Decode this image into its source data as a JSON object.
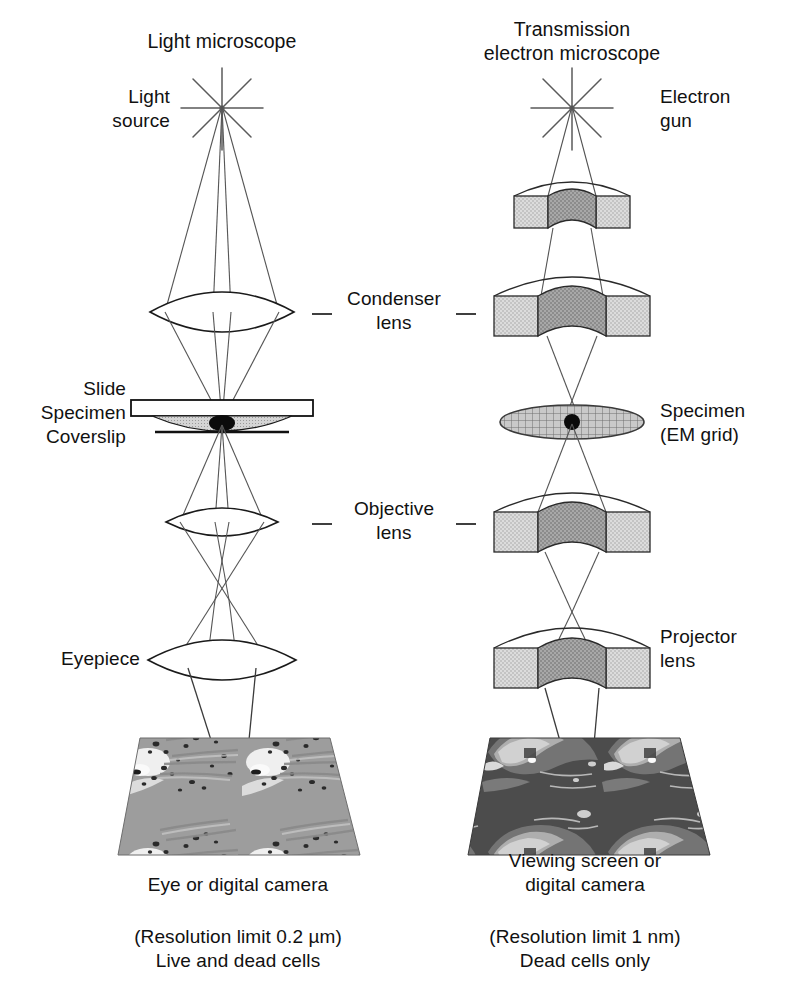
{
  "figure": {
    "background_color": "#ffffff",
    "ink_color": "#111111",
    "ray_color": "#4a4a4a",
    "lens_body_color": "#cfcfcf",
    "lens_core_color": "#8f8f8f",
    "specimen_fill": "#b9b9b9"
  },
  "columns": {
    "left": {
      "title": "Light microscope",
      "title_lines": [
        "Light microscope"
      ],
      "source_label_lines": [
        "Light",
        "source"
      ],
      "source_icon": "starburst-icon",
      "stage_labels": [
        "Slide",
        "Specimen",
        "Coverslip"
      ],
      "eyepiece_label": "Eyepiece",
      "detector_caption_lines": [
        "Eye or digital camera"
      ],
      "footnote_lines": [
        "(Resolution limit 0.2 µm)",
        "Live and dead cells"
      ],
      "image_panel_name": "light-micrograph"
    },
    "right": {
      "title": "Transmission electron microscope",
      "title_lines": [
        "Transmission",
        "electron microscope"
      ],
      "source_label_lines": [
        "Electron",
        "gun"
      ],
      "source_icon": "starburst-icon",
      "specimen_label_lines": [
        "Specimen",
        "(EM grid)"
      ],
      "projector_label_lines": [
        "Projector",
        "lens"
      ],
      "detector_caption_lines": [
        "Viewing screen or",
        "digital camera"
      ],
      "footnote_lines": [
        "(Resolution limit 1 nm)",
        "Dead cells only"
      ],
      "image_panel_name": "electron-micrograph"
    }
  },
  "shared_labels": {
    "condenser": [
      "Condenser",
      "lens"
    ],
    "objective": [
      "Objective",
      "lens"
    ]
  },
  "components": {
    "left_optics": [
      {
        "name": "light-source-star",
        "type": "starburst"
      },
      {
        "name": "condenser-lens-optical",
        "type": "biconvex-lens"
      },
      {
        "name": "slide-assembly",
        "type": "slide"
      },
      {
        "name": "objective-lens-optical",
        "type": "biconvex-lens"
      },
      {
        "name": "eyepiece-lens-optical",
        "type": "biconvex-lens"
      },
      {
        "name": "light-micrograph-panel",
        "type": "image-plane"
      }
    ],
    "right_optics": [
      {
        "name": "electron-gun-star",
        "type": "starburst"
      },
      {
        "name": "condenser-lens-electromagnetic",
        "type": "em-lens"
      },
      {
        "name": "em-grid-specimen",
        "type": "grid-ellipse"
      },
      {
        "name": "objective-lens-electromagnetic",
        "type": "em-lens"
      },
      {
        "name": "projector-lens-electromagnetic",
        "type": "em-lens"
      },
      {
        "name": "electron-micrograph-panel",
        "type": "image-plane"
      }
    ]
  }
}
